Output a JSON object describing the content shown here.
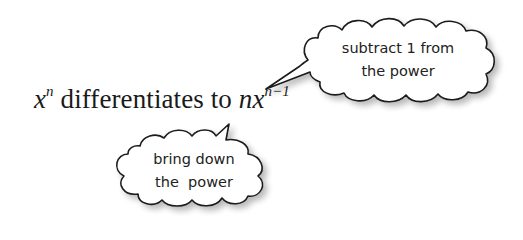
{
  "formula": {
    "base": "x",
    "base_exp": "n",
    "middle": " differentiates to ",
    "coef": "n",
    "result_base": "x",
    "result_exp": "n−1"
  },
  "callouts": [
    {
      "id": "top",
      "lines": [
        "subtract 1 from",
        "the power"
      ],
      "points_to": "exponent n−1"
    },
    {
      "id": "bottom",
      "lines": [
        "bring down",
        "the  power"
      ],
      "points_to": "coefficient n"
    }
  ],
  "colors": {
    "stroke": "#1a1a1a",
    "fill": "#ffffff",
    "shadow": "#cfcfcf"
  }
}
